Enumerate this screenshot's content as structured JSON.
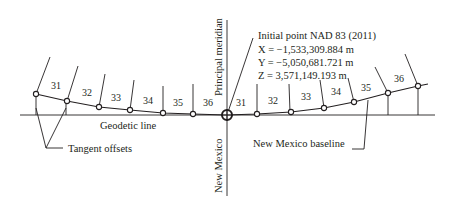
{
  "diagram": {
    "labels": {
      "principal_meridian": "Principal meridian",
      "new_mexico": "New Mexico",
      "geodetic_line": "Geodetic line",
      "tangent_offsets": "Tangent offsets",
      "new_mexico_baseline": "New Mexico baseline"
    },
    "initial_point": {
      "title": "Initial point  NAD 83 (2011)",
      "x_line": "X = −1,533,309.884 m",
      "y_line": "Y = −5,050,681.721 m",
      "z_line": "Z = 3,571,149.193 m"
    },
    "ranges_west": [
      "31",
      "32",
      "33",
      "34",
      "35",
      "36"
    ],
    "ranges_east": [
      "31",
      "32",
      "33",
      "34",
      "35",
      "36"
    ],
    "colors": {
      "ink": "#231f20",
      "background": "#ffffff"
    }
  }
}
